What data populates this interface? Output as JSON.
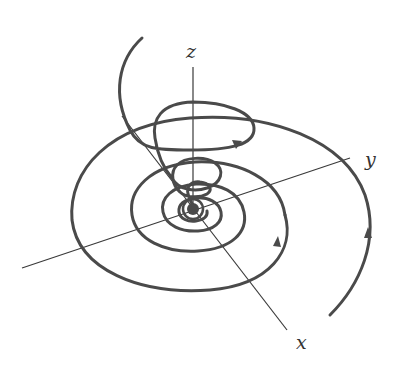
{
  "diagram": {
    "type": "3d-phase-portrait",
    "axes": {
      "x_label": "x",
      "y_label": "y",
      "z_label": "z"
    },
    "colors": {
      "curve": "#4a4a4a",
      "axis": "#3a3a3a",
      "background": "#ffffff"
    }
  }
}
